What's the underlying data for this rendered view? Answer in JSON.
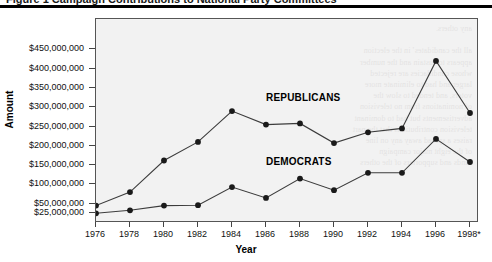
{
  "figure": {
    "title_cutoff": "Figure 1  Campaign Contributions to National Party Committees",
    "bleed_text": "any others.\n\nall the candidates’ in the election\nappears to sustain and the number\nwhose candidacies are rejected\nlarger and had to eliminate more\nvoters, and tended to slow the\nof nominations from no television\nadvertisements but had to dominant\ntelevision contributions that the part\nraises a spread away any on line\nof the eight major campaign\nfunds and supporters of the others"
  },
  "axes": {
    "y_title": "Amount",
    "x_title": "Year",
    "y_ticks": [
      "$450,000,000",
      "$400,000,000",
      "$350,000,000",
      "$300,000,000",
      "$250,000,000",
      "$200,000,000",
      "$150,000,000",
      "$100,000,000",
      "$50,000,000",
      "$25,000,000"
    ],
    "x_ticks": [
      "1976",
      "1978",
      "1980",
      "1982",
      "1984",
      "1986",
      "1988",
      "1990",
      "1992",
      "1994",
      "1996",
      "1998*"
    ]
  },
  "series_labels": {
    "republicans": "REPUBLICANS",
    "democrats": "DEMOCRATS"
  },
  "colors": {
    "line": "#3c3c3c",
    "marker": "#1a1a1a",
    "plot_background": "#f2f2f2",
    "frame": "#555555",
    "text": "#111111"
  },
  "chart_data": {
    "type": "line",
    "title": "Campaign Contributions to National Party Committees",
    "xlabel": "Year",
    "ylabel": "Amount",
    "categories": [
      "1976",
      "1978",
      "1980",
      "1982",
      "1984",
      "1986",
      "1988",
      "1990",
      "1992",
      "1994",
      "1996",
      "1998*"
    ],
    "ylim": [
      0,
      460000000
    ],
    "ytick_values": [
      450000000,
      400000000,
      350000000,
      300000000,
      250000000,
      200000000,
      150000000,
      100000000,
      50000000,
      25000000
    ],
    "grid": false,
    "legend": "inline-labels",
    "series": [
      {
        "name": "REPUBLICANS",
        "values": [
          45000000,
          80000000,
          162000000,
          210000000,
          290000000,
          255000000,
          258000000,
          207000000,
          235000000,
          245000000,
          420000000,
          285000000
        ]
      },
      {
        "name": "DEMOCRATS",
        "values": [
          25000000,
          33000000,
          45000000,
          46000000,
          93000000,
          65000000,
          115000000,
          85000000,
          130000000,
          130000000,
          218000000,
          158000000
        ]
      }
    ],
    "annotations": [
      "* 1998 figure denoted with asterisk"
    ]
  }
}
